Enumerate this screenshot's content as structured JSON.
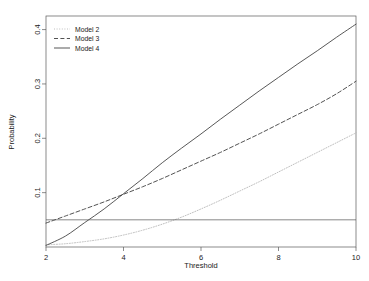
{
  "chart_data": {
    "type": "line",
    "title": "",
    "xlabel": "Threshold",
    "ylabel": "Probability",
    "xlim": [
      2,
      10
    ],
    "ylim": [
      0,
      0.425
    ],
    "xticks": [
      "2",
      "4",
      "6",
      "8",
      "10"
    ],
    "xtick_values": [
      2,
      4,
      6,
      8,
      10
    ],
    "yticks": [
      "0.1",
      "0.2",
      "0.3",
      "0.4"
    ],
    "ytick_values": [
      0.1,
      0.2,
      0.3,
      0.4
    ],
    "grid": false,
    "legend_position": "top-left inside plot",
    "x": [
      2,
      2.5,
      3,
      3.5,
      4,
      4.5,
      5,
      5.5,
      6,
      6.5,
      7,
      7.5,
      8,
      8.5,
      9,
      9.5,
      10
    ],
    "series": [
      {
        "name": "Model 2",
        "style": "dotted",
        "color": "#b4b4b4",
        "values": [
          0.004,
          0.006,
          0.01,
          0.015,
          0.022,
          0.031,
          0.042,
          0.055,
          0.07,
          0.086,
          0.103,
          0.12,
          0.138,
          0.156,
          0.174,
          0.192,
          0.21
        ]
      },
      {
        "name": "Model 3",
        "style": "dashed",
        "color": "#333333",
        "values": [
          0.044,
          0.057,
          0.07,
          0.083,
          0.097,
          0.111,
          0.126,
          0.142,
          0.158,
          0.174,
          0.191,
          0.208,
          0.226,
          0.244,
          0.262,
          0.282,
          0.305
        ]
      },
      {
        "name": "Model 4",
        "style": "solid",
        "color": "#3a3a3a",
        "values": [
          0.003,
          0.02,
          0.045,
          0.07,
          0.098,
          0.126,
          0.155,
          0.182,
          0.208,
          0.235,
          0.261,
          0.287,
          0.312,
          0.337,
          0.361,
          0.386,
          0.41
        ]
      }
    ],
    "reference_line": {
      "name": "threshold-reference-line",
      "orientation": "horizontal",
      "value": 0.05,
      "color": "#555555"
    }
  },
  "legend": {
    "entries": [
      {
        "label": "Model 2"
      },
      {
        "label": "Model 3"
      },
      {
        "label": "Model 4"
      }
    ]
  },
  "axes": {
    "x_title": "Threshold",
    "y_title": "Probability",
    "x_tick_labels": [
      "2",
      "4",
      "6",
      "8",
      "10"
    ],
    "y_tick_labels": [
      "0.1",
      "0.2",
      "0.3",
      "0.4"
    ]
  }
}
